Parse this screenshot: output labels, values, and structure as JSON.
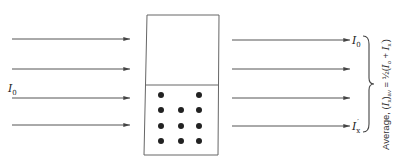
{
  "diagram": {
    "type": "polarization-absorption-schematic",
    "colors": {
      "stroke": "#555555",
      "dot": "#222222",
      "text": "#222222"
    },
    "incident": {
      "label": "I",
      "label_subscript": "0",
      "arrow_count": 4
    },
    "sample": {
      "upper_region": "clear",
      "lower_region": "dotted",
      "dot_rows": [
        [
          true,
          false,
          true
        ],
        [
          true,
          true,
          true
        ],
        [
          true,
          true,
          true
        ],
        [
          true,
          true,
          true
        ]
      ]
    },
    "transmitted": {
      "top_label": "I",
      "top_label_subscript": "0",
      "bottom_label": "I",
      "bottom_label_subscript": "x",
      "bottom_label_prime": "′",
      "arrow_count": 4
    },
    "caption": {
      "prefix": "Average, (",
      "var": "I",
      "var_sub": "x",
      "close": ")",
      "av_sub": "av",
      "equals": " = ",
      "half": "½",
      "open2": "(",
      "term1": "I",
      "term1_sub": "o",
      "plus": " + ",
      "term2": "I",
      "term2_sub": "x",
      "term2_prime": "′",
      "close2": ")"
    }
  }
}
